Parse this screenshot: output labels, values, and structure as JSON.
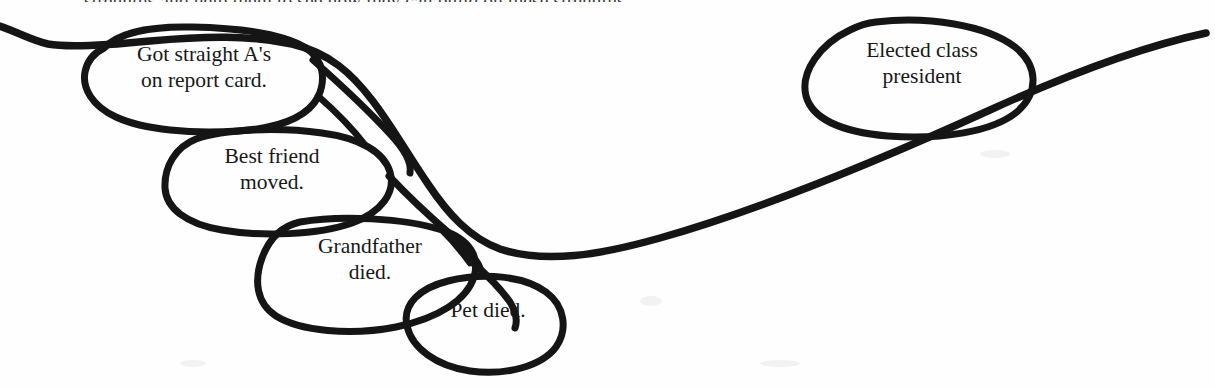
{
  "page": {
    "background_color": "#fefefe",
    "ink_color": "#151515",
    "width": 1215,
    "height": 387,
    "clipped_body_text": "strengths and help them to see how they can build on these strengths."
  },
  "diagram": {
    "type": "hand-drawn-annotated-timeline",
    "title": "",
    "trend_line": {
      "name": "overall-trend-curve",
      "description": "long hand-drawn curve sweeping from left edge down through the cluster of negative events, then rising to the upper right past the positive event"
    },
    "bubbles": [
      {
        "id": "got-straight-as",
        "label": "Got straight A's\non report card.",
        "line1": "Got straight A's",
        "line2": "on report card.",
        "valence": "positive"
      },
      {
        "id": "best-friend-moved",
        "label": "Best friend\nmoved.",
        "line1": "Best friend",
        "line2": "moved.",
        "valence": "negative"
      },
      {
        "id": "grandfather-died",
        "label": "Grandfather\ndied.",
        "line1": "Grandfather",
        "line2": "died.",
        "valence": "negative"
      },
      {
        "id": "pet-died",
        "label": "Pet died.",
        "line1": "Pet died.",
        "line2": "",
        "valence": "negative"
      },
      {
        "id": "elected-class-president",
        "label": "Elected class\npresident",
        "line1": "Elected class",
        "line2": "president",
        "valence": "positive"
      }
    ]
  }
}
